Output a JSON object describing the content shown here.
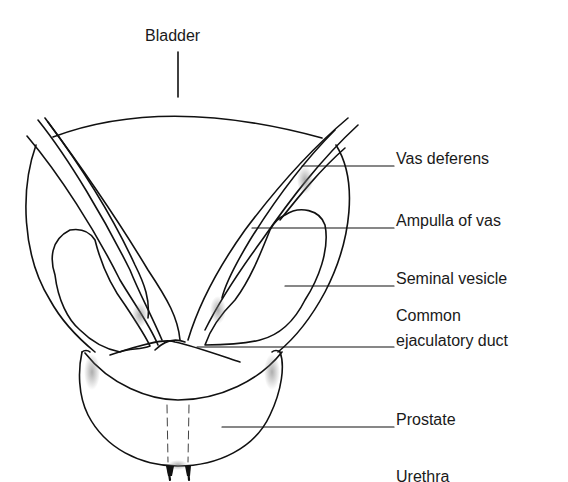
{
  "diagram": {
    "labels": {
      "bladder": "Bladder",
      "vas_deferens": "Vas deferens",
      "ampulla": "Ampulla of vas",
      "seminal_vesicle": "Seminal vesicle",
      "common_line1": "Common",
      "common_line2": "ejaculatory duct",
      "prostate": "Prostate",
      "urethra": "Urethra"
    }
  }
}
